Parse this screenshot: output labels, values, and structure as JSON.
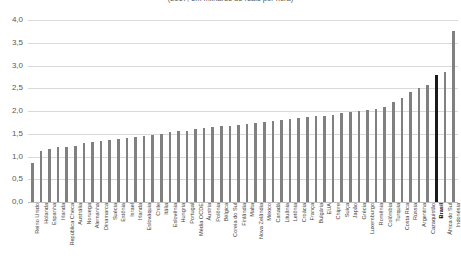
{
  "chart_data": {
    "type": "bar",
    "title": "(2017, em milhares de reais por hora)",
    "xlabel": "",
    "ylabel": "",
    "ylim": [
      0.0,
      4.0
    ],
    "ytick_labels": [
      "0,0",
      "0,5",
      "1,0",
      "1,5",
      "2,0",
      "2,5",
      "3,0",
      "3,5",
      "4,0"
    ],
    "ytick_values": [
      0.0,
      0.5,
      1.0,
      1.5,
      2.0,
      2.5,
      3.0,
      3.5,
      4.0
    ],
    "grid": true,
    "legend": "none",
    "highlight_category": "Brasil",
    "highlight_color": "#1a1a1a",
    "bar_color": "#808080",
    "categories": [
      "Reino Unido",
      "Holanda",
      "Espanha",
      "Irlanda",
      "República Checa",
      "Austrália",
      "Noruega",
      "Alemanha",
      "Dinamarca",
      "Suécia",
      "Estônia",
      "Israel",
      "Irlanda",
      "Eslováquia",
      "Chile",
      "Itália",
      "Eslovênia",
      "Hungria",
      "Portugal",
      "Média OCDE",
      "Áustria",
      "Polônia",
      "Bélgica",
      "Coreia do Sul",
      "Finlândia",
      "Malta",
      "Nova Zelândia",
      "México",
      "Canadá",
      "Lituânia",
      "Letônia",
      "Croácia",
      "França",
      "Bulgária",
      "EUA",
      "Chipre",
      "Suíça",
      "Japão",
      "Grécia",
      "Luxemburgo",
      "Romênia",
      "Colômbia",
      "Turquia",
      "Costa Rica",
      "Rússia",
      "Argentina",
      "Cazaquistão",
      "Brasil",
      "África do Sul",
      "Indonésia"
    ],
    "values": [
      0.85,
      1.12,
      1.17,
      1.2,
      1.22,
      1.24,
      1.3,
      1.32,
      1.34,
      1.36,
      1.38,
      1.4,
      1.42,
      1.45,
      1.47,
      1.5,
      1.53,
      1.55,
      1.57,
      1.6,
      1.62,
      1.64,
      1.66,
      1.68,
      1.7,
      1.72,
      1.74,
      1.76,
      1.78,
      1.8,
      1.82,
      1.84,
      1.86,
      1.88,
      1.9,
      1.92,
      1.95,
      1.97,
      2.0,
      2.02,
      2.05,
      2.08,
      2.2,
      2.28,
      2.42,
      2.5,
      2.58,
      2.8,
      2.85,
      3.75
    ]
  }
}
